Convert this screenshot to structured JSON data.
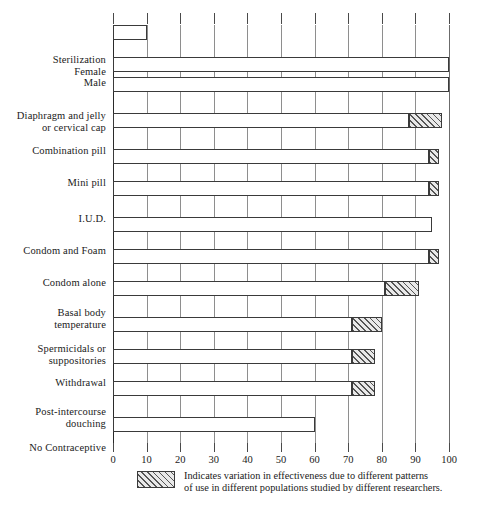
{
  "chart_data": {
    "type": "bar",
    "orientation": "horizontal",
    "title": "",
    "xlabel": "",
    "ylabel": "",
    "xlim": [
      0,
      100
    ],
    "xticks": [
      "0",
      "10",
      "20",
      "30",
      "40",
      "50",
      "60",
      "70",
      "80",
      "90",
      "100"
    ],
    "xtick_values": [
      0,
      10,
      20,
      30,
      40,
      50,
      60,
      70,
      80,
      90,
      100
    ],
    "grid": true,
    "legend_position": "below-axis",
    "categories": [
      "Sterilization\nFemale\nMale",
      "Diaphragm and jelly\nor cervical cap",
      "Combination pill",
      "Mini pill",
      "I.U.D.",
      "Condom and Foam",
      "Condom alone",
      "Basal body\ntemperature",
      "Spermicidals or\nsuppositories",
      "Withdrawal",
      "Post-intercourse\ndouching",
      "No Contraceptive"
    ],
    "bars": [
      {
        "label": "Sterilization Female",
        "category_index": 0,
        "value": 100,
        "solid_end": 100,
        "hatch_start": null,
        "hatch_end": null
      },
      {
        "label": "Sterilization Male",
        "category_index": 0,
        "value": 100,
        "solid_end": 100,
        "hatch_start": null,
        "hatch_end": null
      },
      {
        "label": "Diaphragm and jelly or cervical cap",
        "category_index": 1,
        "value": 98,
        "solid_end": 88,
        "hatch_start": 88,
        "hatch_end": 98
      },
      {
        "label": "Combination pill",
        "category_index": 2,
        "value": 97,
        "solid_end": 94,
        "hatch_start": 94,
        "hatch_end": 97
      },
      {
        "label": "Mini pill",
        "category_index": 3,
        "value": 97,
        "solid_end": 94,
        "hatch_start": 94,
        "hatch_end": 97
      },
      {
        "label": "I.U.D.",
        "category_index": 4,
        "value": 95,
        "solid_end": 95,
        "hatch_start": null,
        "hatch_end": null
      },
      {
        "label": "Condom and Foam",
        "category_index": 5,
        "value": 97,
        "solid_end": 94,
        "hatch_start": 94,
        "hatch_end": 97
      },
      {
        "label": "Condom alone",
        "category_index": 6,
        "value": 91,
        "solid_end": 81,
        "hatch_start": 81,
        "hatch_end": 91
      },
      {
        "label": "Basal body temperature",
        "category_index": 7,
        "value": 80,
        "solid_end": 71,
        "hatch_start": 71,
        "hatch_end": 80
      },
      {
        "label": "Spermicidals or suppositories",
        "category_index": 8,
        "value": 78,
        "solid_end": 71,
        "hatch_start": 71,
        "hatch_end": 78
      },
      {
        "label": "Withdrawal",
        "category_index": 9,
        "value": 78,
        "solid_end": 71,
        "hatch_start": 71,
        "hatch_end": 78
      },
      {
        "label": "Post-intercourse douching",
        "category_index": 10,
        "value": 60,
        "solid_end": 60,
        "hatch_start": null,
        "hatch_end": null
      },
      {
        "label": "No Contraceptive",
        "category_index": 11,
        "value": 10,
        "solid_end": 10,
        "hatch_start": null,
        "hatch_end": null
      }
    ],
    "legend": [
      {
        "swatch": "hatched",
        "text": "Indicates variation in effectiveness due to different patterns\nof use in different populations studied by different researchers."
      }
    ],
    "colors": {
      "bar_fill": "#ffffff",
      "bar_stroke": "#3a3a3a",
      "hatch_fill": "#e9e9e9",
      "hatch_stroke": "#555555",
      "gridline": "#8e8e8e",
      "axis": "#2a2a2a",
      "text": "#1a1a1a"
    }
  },
  "layout": {
    "bar_tops": [
      32,
      52,
      88,
      124,
      156,
      192,
      224,
      256,
      292,
      324,
      356,
      392
    ],
    "bar_height": 15,
    "label_tops": [
      29,
      85,
      120,
      152,
      188,
      220,
      252,
      282,
      318,
      352,
      381,
      417
    ]
  }
}
